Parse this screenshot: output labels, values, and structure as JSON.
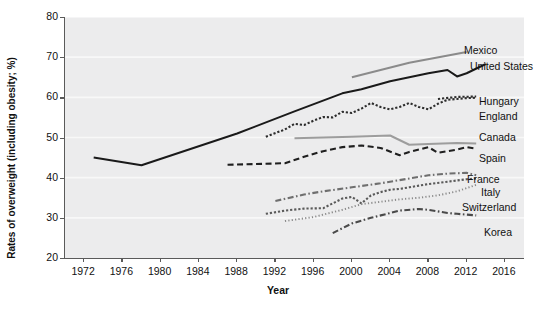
{
  "chart_data": {
    "type": "line",
    "title": "",
    "xlabel": "Year",
    "ylabel": "Rates of overweight (including obesity; %)",
    "xlim": [
      1970,
      2018
    ],
    "ylim": [
      20,
      80
    ],
    "xticks": [
      "1972",
      "1976",
      "1980",
      "1984",
      "1988",
      "1992",
      "1996",
      "2000",
      "2004",
      "2008",
      "2012",
      "2016"
    ],
    "yticks": [
      "20",
      "30",
      "40",
      "50",
      "60",
      "70",
      "80"
    ],
    "grid": "horizontal",
    "legend_position": "inline-right",
    "series": [
      {
        "name": "Mexico",
        "color": "#8b8b8b",
        "style": "solid",
        "label": "Mexico",
        "points": [
          [
            2000,
            65.0
          ],
          [
            2006,
            68.6
          ],
          [
            2012,
            71.3
          ]
        ]
      },
      {
        "name": "United States",
        "color": "#1a1a1a",
        "style": "solid",
        "label": "United States",
        "points": [
          [
            1973,
            45.0
          ],
          [
            1978,
            43.1
          ],
          [
            1988,
            51.0
          ],
          [
            1994,
            56.5
          ],
          [
            1999,
            61.0
          ],
          [
            2001,
            62.0
          ],
          [
            2004,
            64.0
          ],
          [
            2006,
            65.0
          ],
          [
            2008,
            66.0
          ],
          [
            2010,
            66.8
          ],
          [
            2011,
            65.2
          ],
          [
            2012,
            66.0
          ],
          [
            2014,
            68.3
          ]
        ]
      },
      {
        "name": "Hungary",
        "color": "#2d2d2d",
        "style": "dotted",
        "label": "Hungary",
        "points": [
          [
            1991,
            50.2
          ],
          [
            1993,
            52.0
          ],
          [
            1994,
            53.4
          ],
          [
            1995,
            53.1
          ],
          [
            1996,
            54.2
          ],
          [
            1997,
            55.1
          ],
          [
            1998,
            55.0
          ],
          [
            1999,
            56.4
          ],
          [
            2000,
            56.1
          ],
          [
            2001,
            57.2
          ],
          [
            2002,
            58.6
          ],
          [
            2003,
            57.6
          ],
          [
            2004,
            57.0
          ],
          [
            2005,
            57.6
          ],
          [
            2006,
            58.6
          ],
          [
            2007,
            57.6
          ],
          [
            2008,
            57.0
          ],
          [
            2009,
            58.4
          ],
          [
            2010,
            59.4
          ],
          [
            2011,
            59.6
          ],
          [
            2012,
            59.8
          ],
          [
            2013,
            59.9
          ]
        ]
      },
      {
        "name": "England",
        "color": "#2d2d2d",
        "style": "dotted",
        "label": "England",
        "points": [
          [
            2009,
            59.6
          ],
          [
            2011,
            60.1
          ],
          [
            2013,
            60.2
          ]
        ]
      },
      {
        "name": "Canada",
        "color": "#9d9d9d",
        "style": "solid",
        "label": "Canada",
        "points": [
          [
            1994,
            49.8
          ],
          [
            2000,
            50.2
          ],
          [
            2004,
            50.5
          ],
          [
            2006,
            48.2
          ],
          [
            2008,
            48.4
          ],
          [
            2011,
            48.6
          ],
          [
            2013,
            48.5
          ]
        ]
      },
      {
        "name": "Spain",
        "color": "#1f1f1f",
        "style": "dashed",
        "label": "Spain",
        "points": [
          [
            1987,
            43.2
          ],
          [
            1993,
            43.6
          ],
          [
            1995,
            45.2
          ],
          [
            1997,
            46.6
          ],
          [
            1999,
            47.6
          ],
          [
            2001,
            48.0
          ],
          [
            2003,
            47.4
          ],
          [
            2005,
            45.6
          ],
          [
            2006,
            46.4
          ],
          [
            2008,
            47.6
          ],
          [
            2009,
            46.2
          ],
          [
            2011,
            47.0
          ],
          [
            2012,
            47.6
          ],
          [
            2013,
            47.2
          ]
        ]
      },
      {
        "name": "France",
        "color": "#6f6f6f",
        "style": "dashdot",
        "label": "France",
        "points": [
          [
            1992,
            34.2
          ],
          [
            1995,
            35.8
          ],
          [
            1997,
            36.6
          ],
          [
            2000,
            37.6
          ],
          [
            2003,
            38.6
          ],
          [
            2006,
            39.8
          ],
          [
            2008,
            40.6
          ],
          [
            2010,
            41.0
          ],
          [
            2012,
            41.2
          ],
          [
            2013,
            40.6
          ]
        ]
      },
      {
        "name": "Italy",
        "color": "#5a5a5a",
        "style": "dotted",
        "label": "Italy",
        "points": [
          [
            1991,
            31.0
          ],
          [
            1993,
            31.8
          ],
          [
            1995,
            32.3
          ],
          [
            1997,
            32.4
          ],
          [
            1999,
            34.8
          ],
          [
            2000,
            35.2
          ],
          [
            2001,
            33.6
          ],
          [
            2002,
            35.6
          ],
          [
            2003,
            36.4
          ],
          [
            2004,
            37.0
          ],
          [
            2005,
            37.2
          ],
          [
            2006,
            37.6
          ],
          [
            2008,
            38.4
          ],
          [
            2010,
            39.0
          ],
          [
            2012,
            39.6
          ],
          [
            2013,
            39.8
          ]
        ]
      },
      {
        "name": "Switzerland",
        "color": "#8a8a8a",
        "style": "fine-dotted",
        "label": "Switzerland",
        "points": [
          [
            1993,
            29.2
          ],
          [
            1996,
            30.2
          ],
          [
            1999,
            32.0
          ],
          [
            2001,
            33.4
          ],
          [
            2003,
            34.0
          ],
          [
            2005,
            34.6
          ],
          [
            2007,
            35.0
          ],
          [
            2009,
            35.6
          ],
          [
            2011,
            36.6
          ],
          [
            2012,
            37.4
          ],
          [
            2013,
            38.2
          ]
        ]
      },
      {
        "name": "Korea",
        "color": "#4a4a4a",
        "style": "dashdot",
        "label": "Korea",
        "points": [
          [
            1998,
            26.2
          ],
          [
            2000,
            28.6
          ],
          [
            2002,
            30.0
          ],
          [
            2004,
            31.2
          ],
          [
            2005,
            31.8
          ],
          [
            2007,
            32.2
          ],
          [
            2008,
            32.0
          ],
          [
            2010,
            31.2
          ],
          [
            2011,
            31.0
          ],
          [
            2013,
            30.6
          ]
        ]
      }
    ]
  }
}
